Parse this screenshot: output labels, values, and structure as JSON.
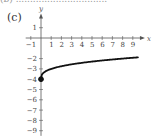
{
  "top_text": "(b) ................................",
  "panel_label": "(c)",
  "chart_data": {
    "type": "line",
    "title": "",
    "function_description": "y = cube root of x minus 4, starting at closed point (0, -4)",
    "xlabel": "x",
    "ylabel": "y",
    "x_ticks": [
      -1,
      1,
      2,
      3,
      4,
      5,
      6,
      7,
      8,
      9
    ],
    "y_ticks": [
      1,
      -2,
      -3,
      -4,
      -5,
      -6,
      -7,
      -8,
      -9
    ],
    "xlim": [
      -1.5,
      9.8
    ],
    "ylim": [
      -9.5,
      2
    ],
    "grid": false,
    "legend": null,
    "start_point": {
      "x": 0,
      "y": -4,
      "filled": true
    },
    "series": [
      {
        "name": "curve",
        "x": [
          0,
          0.125,
          0.5,
          1,
          2,
          3,
          4,
          5,
          6,
          7,
          8,
          9,
          9.5
        ],
        "y": [
          -4,
          -3.5,
          -3.21,
          -3,
          -2.74,
          -2.56,
          -2.41,
          -2.29,
          -2.18,
          -2.09,
          -2,
          -1.92,
          -1.88
        ]
      }
    ],
    "colors": {
      "axis": "#555555",
      "curve": "#111111"
    }
  }
}
